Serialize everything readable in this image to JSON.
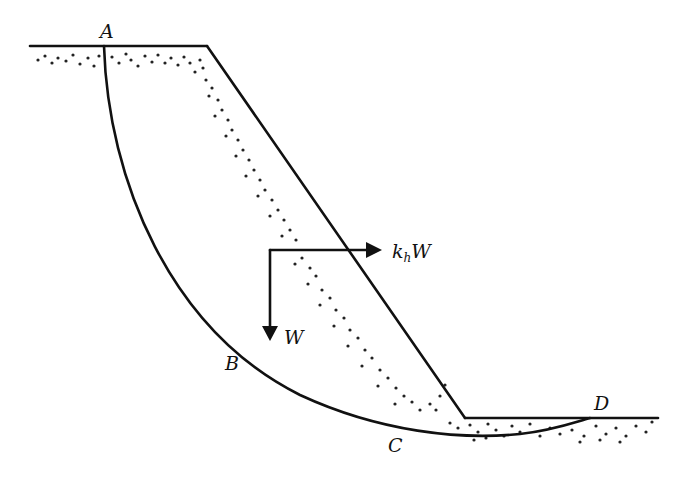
{
  "diagram": {
    "title": "",
    "labels": {
      "A": "A",
      "B": "B",
      "C": "C",
      "D": "D",
      "weight": "W",
      "seismic_coef": "k",
      "seismic_sub": "h",
      "seismic_force_suffix": "W"
    },
    "colors": {
      "line": "#111111",
      "background": "#ffffff",
      "soil_dots": "#222222"
    },
    "geometry": {
      "crest_line": [
        [
          30,
          46
        ],
        [
          207,
          46
        ]
      ],
      "slope_face": [
        [
          207,
          46
        ],
        [
          465,
          418
        ]
      ],
      "toe_line": [
        [
          465,
          418
        ],
        [
          658,
          418
        ]
      ],
      "slip_surface_start": [
        104,
        46
      ],
      "slip_surface_end": [
        590,
        418
      ],
      "weight_arrow": {
        "from": [
          270,
          250
        ],
        "to": [
          270,
          340
        ]
      },
      "seismic_arrow": {
        "from": [
          270,
          250
        ],
        "to": [
          382,
          250
        ]
      }
    }
  }
}
